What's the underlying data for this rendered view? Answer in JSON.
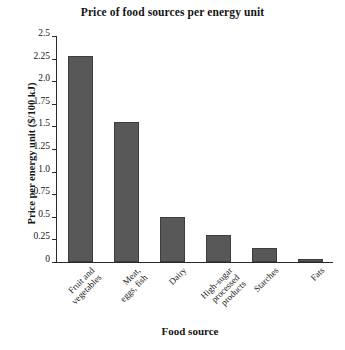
{
  "chart_data": {
    "type": "bar",
    "title": "Price of food sources per energy unit",
    "xlabel": "Food source",
    "ylabel": "Price per energy unit ($/100 kJ)",
    "categories": [
      "Fruit and vegetables",
      "Meat, eggs, fish",
      "Dairy",
      "High-sugar processed products",
      "Starches",
      "Fats"
    ],
    "category_lines": [
      [
        "Fruit and",
        "vegetables"
      ],
      [
        "Meat,",
        "eggs, fish"
      ],
      [
        "Dairy"
      ],
      [
        "High-sugar",
        "processed",
        "products"
      ],
      [
        "Starches"
      ],
      [
        "Fats"
      ]
    ],
    "values": [
      2.28,
      1.55,
      0.5,
      0.3,
      0.15,
      0.03
    ],
    "ylim": [
      0,
      2.5
    ],
    "yticks": [
      0,
      0.25,
      0.5,
      0.75,
      1.0,
      1.25,
      1.5,
      1.75,
      2.0,
      2.25,
      2.5
    ],
    "ytick_labels": [
      "0",
      "0.25",
      "0.5",
      "0.75",
      "1.0",
      "1.25",
      "1.5",
      "1.75",
      "2.0",
      "2.25",
      "2.5"
    ],
    "grid": false,
    "legend": null,
    "bar_color": "#585858",
    "bar_edge_color": "#3d3d3d",
    "axis_color": "#2a2a2a",
    "background": "#ffffff"
  }
}
